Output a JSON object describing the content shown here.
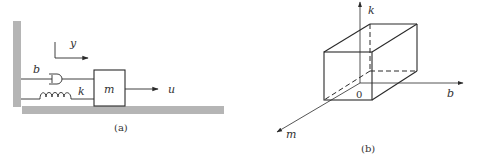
{
  "figure_a": {
    "caption": "(a)",
    "labels": {
      "damper": "b",
      "spring": "k",
      "mass": "m",
      "input": "u",
      "displacement": "y"
    }
  },
  "figure_b": {
    "caption": "(b)",
    "axes": {
      "vertical": "k",
      "horizontal": "b",
      "depth": "m",
      "origin": "0"
    }
  },
  "colors": {
    "stroke": "#2a2a2a",
    "ground": "#b5b5b5",
    "text": "#333333"
  }
}
